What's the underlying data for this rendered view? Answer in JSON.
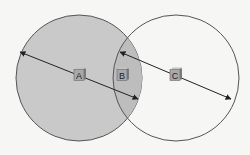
{
  "diagram": {
    "type": "venn",
    "background": "#f6f6f4",
    "circles": [
      {
        "id": "left",
        "cx": 79,
        "cy": 78,
        "r": 63,
        "fill": "#c9c9c9",
        "stroke": "#555555"
      },
      {
        "id": "right",
        "cx": 176,
        "cy": 78,
        "r": 63,
        "fill": "none",
        "stroke": "#555555"
      }
    ],
    "overlap_fill": "#bdbdbd",
    "arrows": [
      {
        "id": "diameter-a",
        "x1": 20,
        "y1": 52,
        "x2": 138,
        "y2": 99
      },
      {
        "id": "diameter-c",
        "x1": 120,
        "y1": 52,
        "x2": 231,
        "y2": 99
      }
    ],
    "labels": [
      {
        "id": "A",
        "text": "A",
        "x": 79,
        "y": 75
      },
      {
        "id": "B",
        "text": "B",
        "x": 122,
        "y": 75
      },
      {
        "id": "C",
        "text": "C",
        "x": 175,
        "y": 75
      }
    ],
    "cube_colors": {
      "face": "#a9a9a9",
      "side": "#7d7d7d",
      "top": "#c4c4c4",
      "border": "#6a6a6a"
    }
  }
}
